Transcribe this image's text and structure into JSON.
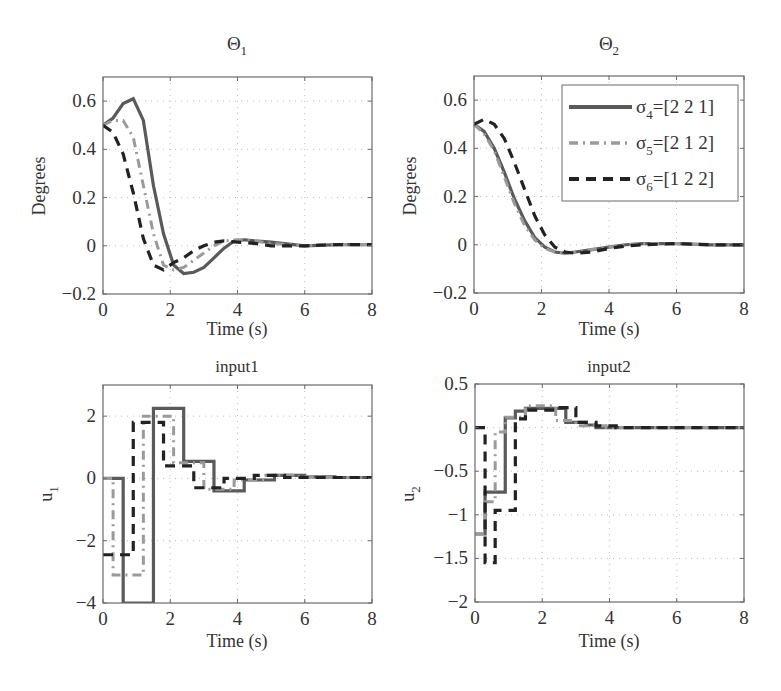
{
  "figure": {
    "colors": {
      "sigma4": "#5a5a5a",
      "sigma5": "#9a9a9a",
      "sigma6": "#222222",
      "axis": "#6a6a6a",
      "grid": "#bdbdbd",
      "text": "#333333"
    },
    "legend": {
      "entries": [
        {
          "symbol": "σ",
          "sub": "4",
          "text": "=[2 2 1]",
          "style": "solid"
        },
        {
          "symbol": "σ",
          "sub": "5",
          "text": "=[2 1 2]",
          "style": "dashdot"
        },
        {
          "symbol": "σ",
          "sub": "6",
          "text": "=[1 2 2]",
          "style": "dashed"
        }
      ]
    }
  },
  "chart_data": [
    {
      "id": "theta1",
      "type": "line",
      "title": "Θ",
      "title_sub": "1",
      "xlabel": "Time (s)",
      "ylabel": "Degrees",
      "ylabel_sub": "",
      "xlim": [
        0,
        8
      ],
      "ylim": [
        -0.2,
        0.7
      ],
      "xticks": [
        0,
        2,
        4,
        6,
        8
      ],
      "xtick_labels": [
        "0",
        "2",
        "4",
        "6",
        "8"
      ],
      "yticks": [
        -0.2,
        0,
        0.2,
        0.4,
        0.6
      ],
      "ytick_labels": [
        "−0.2",
        "0",
        "0.2",
        "0.4",
        "0.6"
      ],
      "grid": true,
      "legend": false,
      "box": {
        "x0": 103,
        "y0": 77,
        "x1": 372,
        "y1": 294
      },
      "series": [
        {
          "name": "σ4=[2 2 1]",
          "style": "solid",
          "x": [
            0,
            0.3,
            0.6,
            0.9,
            1.2,
            1.5,
            1.8,
            2.1,
            2.4,
            2.7,
            3.0,
            3.3,
            3.6,
            3.9,
            4.2,
            4.5,
            5.0,
            6.0,
            7.0,
            8.0
          ],
          "y": [
            0.5,
            0.53,
            0.59,
            0.61,
            0.52,
            0.25,
            0.05,
            -0.08,
            -0.115,
            -0.11,
            -0.09,
            -0.05,
            -0.01,
            0.02,
            0.025,
            0.02,
            0.015,
            0.0,
            0.005,
            0.005
          ]
        },
        {
          "name": "σ5=[2 1 2]",
          "style": "dashdot",
          "x": [
            0,
            0.3,
            0.6,
            0.9,
            1.2,
            1.5,
            1.8,
            2.1,
            2.4,
            2.7,
            3.0,
            3.3,
            3.6,
            4.0,
            4.5,
            5.0,
            6.0,
            7.0,
            8.0
          ],
          "y": [
            0.5,
            0.52,
            0.52,
            0.45,
            0.25,
            0.05,
            -0.08,
            -0.1,
            -0.09,
            -0.06,
            -0.03,
            0.0,
            0.02,
            0.025,
            0.02,
            0.01,
            0.0,
            0.005,
            0.005
          ]
        },
        {
          "name": "σ6=[1 2 2]",
          "style": "dashed",
          "x": [
            0,
            0.3,
            0.6,
            0.9,
            1.2,
            1.5,
            1.8,
            2.1,
            2.4,
            2.7,
            3.0,
            3.3,
            3.6,
            4.0,
            4.5,
            5.0,
            6.0,
            7.0,
            8.0
          ],
          "y": [
            0.5,
            0.47,
            0.38,
            0.22,
            0.03,
            -0.08,
            -0.1,
            -0.07,
            -0.05,
            -0.02,
            0.0,
            0.015,
            0.02,
            0.015,
            0.01,
            0.0,
            0.0,
            0.005,
            0.005
          ]
        }
      ]
    },
    {
      "id": "theta2",
      "type": "line",
      "title": "Θ",
      "title_sub": "2",
      "xlabel": "Time (s)",
      "ylabel": "Degrees",
      "ylabel_sub": "",
      "xlim": [
        0,
        8
      ],
      "ylim": [
        -0.2,
        0.7
      ],
      "xticks": [
        0,
        2,
        4,
        6,
        8
      ],
      "xtick_labels": [
        "0",
        "2",
        "4",
        "6",
        "8"
      ],
      "yticks": [
        -0.2,
        0,
        0.2,
        0.4,
        0.6
      ],
      "ytick_labels": [
        "−0.2",
        "0",
        "0.2",
        "0.4",
        "0.6"
      ],
      "grid": true,
      "legend": true,
      "legend_position": "upper right",
      "box": {
        "x0": 474,
        "y0": 76,
        "x1": 744,
        "y1": 293
      },
      "series": [
        {
          "name": "σ4=[2 2 1]",
          "style": "solid",
          "x": [
            0,
            0.3,
            0.6,
            0.9,
            1.2,
            1.5,
            1.8,
            2.1,
            2.4,
            2.7,
            3.0,
            3.5,
            4.0,
            4.5,
            5.0,
            6.0,
            7.0,
            8.0
          ],
          "y": [
            0.5,
            0.47,
            0.4,
            0.3,
            0.19,
            0.1,
            0.03,
            -0.01,
            -0.03,
            -0.035,
            -0.03,
            -0.02,
            -0.01,
            0.0,
            0.005,
            0.005,
            0.0,
            0.0
          ]
        },
        {
          "name": "σ5=[2 1 2]",
          "style": "dashdot",
          "x": [
            0,
            0.3,
            0.6,
            0.9,
            1.2,
            1.5,
            1.8,
            2.1,
            2.4,
            2.7,
            3.0,
            3.5,
            4.0,
            4.5,
            5.0,
            6.0,
            7.0,
            8.0
          ],
          "y": [
            0.5,
            0.46,
            0.39,
            0.28,
            0.17,
            0.08,
            0.02,
            -0.015,
            -0.03,
            -0.035,
            -0.03,
            -0.02,
            -0.01,
            0.0,
            0.005,
            0.005,
            0.0,
            0.0
          ]
        },
        {
          "name": "σ6=[1 2 2]",
          "style": "dashed",
          "x": [
            0,
            0.3,
            0.6,
            0.9,
            1.2,
            1.5,
            1.8,
            2.1,
            2.4,
            2.7,
            3.0,
            3.5,
            4.0,
            4.5,
            5.0,
            6.0,
            7.0,
            8.0
          ],
          "y": [
            0.5,
            0.52,
            0.5,
            0.44,
            0.34,
            0.23,
            0.12,
            0.04,
            -0.01,
            -0.03,
            -0.035,
            -0.03,
            -0.015,
            -0.005,
            0.0,
            0.005,
            0.0,
            0.0
          ]
        }
      ]
    },
    {
      "id": "input1",
      "type": "line",
      "step": true,
      "title": "input1",
      "title_sub": "",
      "xlabel": "Time (s)",
      "ylabel": "u",
      "ylabel_sub": "1",
      "xlim": [
        0,
        8
      ],
      "ylim": [
        -4,
        3
      ],
      "xticks": [
        0,
        2,
        4,
        6,
        8
      ],
      "xtick_labels": [
        "0",
        "2",
        "4",
        "6",
        "8"
      ],
      "yticks": [
        -4,
        -2,
        0,
        2
      ],
      "ytick_labels": [
        "−4",
        "−2",
        "0",
        "2"
      ],
      "grid": true,
      "legend": false,
      "box": {
        "x0": 103,
        "y0": 385,
        "x1": 372,
        "y1": 603
      },
      "series": [
        {
          "name": "σ4=[2 2 1]",
          "style": "solid",
          "x": [
            0,
            0.6,
            1.5,
            2.4,
            3.3,
            4.2,
            5.1,
            6.0,
            6.9,
            8.0
          ],
          "y": [
            0,
            -4.0,
            2.25,
            0.55,
            -0.4,
            -0.05,
            0.1,
            0.05,
            0.03,
            0.03
          ]
        },
        {
          "name": "σ5=[2 1 2]",
          "style": "dashdot",
          "x": [
            0,
            0.3,
            1.2,
            2.1,
            3.0,
            3.9,
            4.8,
            5.7,
            6.6,
            8.0
          ],
          "y": [
            0,
            -3.1,
            2.0,
            0.5,
            -0.35,
            -0.05,
            0.1,
            0.05,
            0.03,
            0.03
          ]
        },
        {
          "name": "σ6=[1 2 2]",
          "style": "dashed",
          "x": [
            0,
            0.9,
            1.8,
            2.7,
            3.6,
            4.5,
            5.4,
            6.3,
            7.2,
            8.0
          ],
          "y": [
            -2.45,
            1.8,
            0.4,
            -0.3,
            0.0,
            0.1,
            0.03,
            0.03,
            0.03,
            0.03
          ]
        }
      ]
    },
    {
      "id": "input2",
      "type": "line",
      "step": true,
      "title": "input2",
      "title_sub": "",
      "xlabel": "Time (s)",
      "ylabel": "u",
      "ylabel_sub": "2",
      "xlim": [
        0,
        8
      ],
      "ylim": [
        -2,
        0.5
      ],
      "xticks": [
        0,
        2,
        4,
        6,
        8
      ],
      "xtick_labels": [
        "0",
        "2",
        "4",
        "6",
        "8"
      ],
      "yticks": [
        -2,
        -1.5,
        -1,
        -0.5,
        0,
        0.5
      ],
      "ytick_labels": [
        "−2",
        "−1.5",
        "−1",
        "−0.5",
        "0",
        "0.5"
      ],
      "grid": true,
      "legend": false,
      "box": {
        "x0": 475,
        "y0": 384,
        "x1": 744,
        "y1": 602
      },
      "series": [
        {
          "name": "σ4=[2 2 1]",
          "style": "solid",
          "x": [
            0,
            0.3,
            0.9,
            1.2,
            1.5,
            2.7,
            3.3,
            3.6,
            4.5,
            8.0
          ],
          "y": [
            -1.22,
            -0.74,
            0.11,
            0.19,
            0.22,
            0.06,
            0.03,
            0.0,
            0.0,
            0.0
          ]
        },
        {
          "name": "σ5=[2 1 2]",
          "style": "dashdot",
          "x": [
            0,
            0.3,
            0.6,
            0.9,
            1.5,
            2.4,
            3.0,
            3.9,
            4.8,
            8.0
          ],
          "y": [
            -1.22,
            -0.85,
            -0.05,
            0.12,
            0.25,
            0.08,
            0.02,
            0.0,
            0.0,
            0.0
          ]
        },
        {
          "name": "σ6=[1 2 2]",
          "style": "dashed",
          "x": [
            0,
            0.3,
            0.6,
            1.2,
            1.5,
            2.4,
            3.0,
            3.6,
            4.2,
            8.0
          ],
          "y": [
            0.0,
            -1.55,
            -0.95,
            0.1,
            0.2,
            0.23,
            0.06,
            0.02,
            0.0,
            0.0
          ]
        }
      ]
    }
  ],
  "caption_fragment": ""
}
